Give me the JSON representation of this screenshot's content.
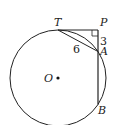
{
  "diagram": {
    "type": "geometry",
    "points": {
      "T": {
        "label": "T",
        "x": 58,
        "y": 30
      },
      "P": {
        "label": "P",
        "x": 98,
        "y": 30
      },
      "A": {
        "label": "A",
        "x": 98,
        "y": 51.5
      },
      "B": {
        "label": "B",
        "x": 98,
        "y": 104.5
      },
      "O": {
        "label": "O",
        "x": 58,
        "y": 78
      }
    },
    "circle": {
      "cx": 58,
      "cy": 78,
      "r": 48
    },
    "measures": {
      "PA": "3",
      "TA": "6"
    },
    "right_angle_at": "P",
    "colors": {
      "stroke": "#222222",
      "background": "#ffffff"
    }
  }
}
